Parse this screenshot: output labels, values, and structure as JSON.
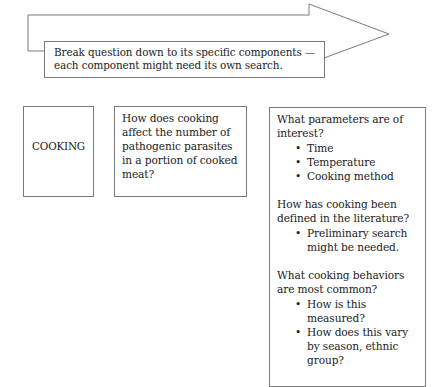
{
  "arrow": {
    "label": "Break question down to its specific components — each component might need its own search.",
    "icon": "right-arrow-outline"
  },
  "boxes": {
    "topic": {
      "label": "COOKING"
    },
    "question": {
      "text": "How does cooking affect the number of pathogenic parasites in a portion of cooked meat?"
    },
    "components": {
      "sections": [
        {
          "question": "What parameters are of interest?",
          "bullets": [
            "Time",
            "Temperature",
            "Cooking method"
          ]
        },
        {
          "question": "How has cooking been defined in the literature?",
          "bullets": [
            "Preliminary search might be needed."
          ]
        },
        {
          "question": "What cooking behaviors are most common?",
          "bullets": [
            "How is this measured?",
            "How does this vary by season, ethnic group?"
          ]
        }
      ]
    }
  },
  "colors": {
    "stroke": "#7a7a7a",
    "text": "#222222",
    "background": "#ffffff"
  }
}
